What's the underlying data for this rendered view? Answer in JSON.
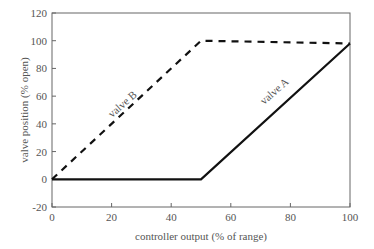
{
  "chart_data": {
    "type": "line",
    "title": "",
    "xlabel": "controller output (% of range)",
    "ylabel": "valve position (% open)",
    "xlim": [
      0,
      100
    ],
    "ylim": [
      -20,
      120
    ],
    "xticks": [
      "0",
      "20",
      "40",
      "60",
      "80",
      "100"
    ],
    "yticks": [
      "-20",
      "0",
      "20",
      "40",
      "60",
      "80",
      "100",
      "120"
    ],
    "grid": false,
    "legend": "none (inline labels)",
    "series": [
      {
        "name": "valve A",
        "style": "solid",
        "x": [
          0,
          50,
          100
        ],
        "y": [
          0,
          0,
          98
        ]
      },
      {
        "name": "valve B",
        "style": "dashed",
        "x": [
          0,
          50,
          100
        ],
        "y": [
          0,
          100,
          98
        ]
      }
    ],
    "annotations": [
      "valve A",
      "valve B"
    ]
  }
}
